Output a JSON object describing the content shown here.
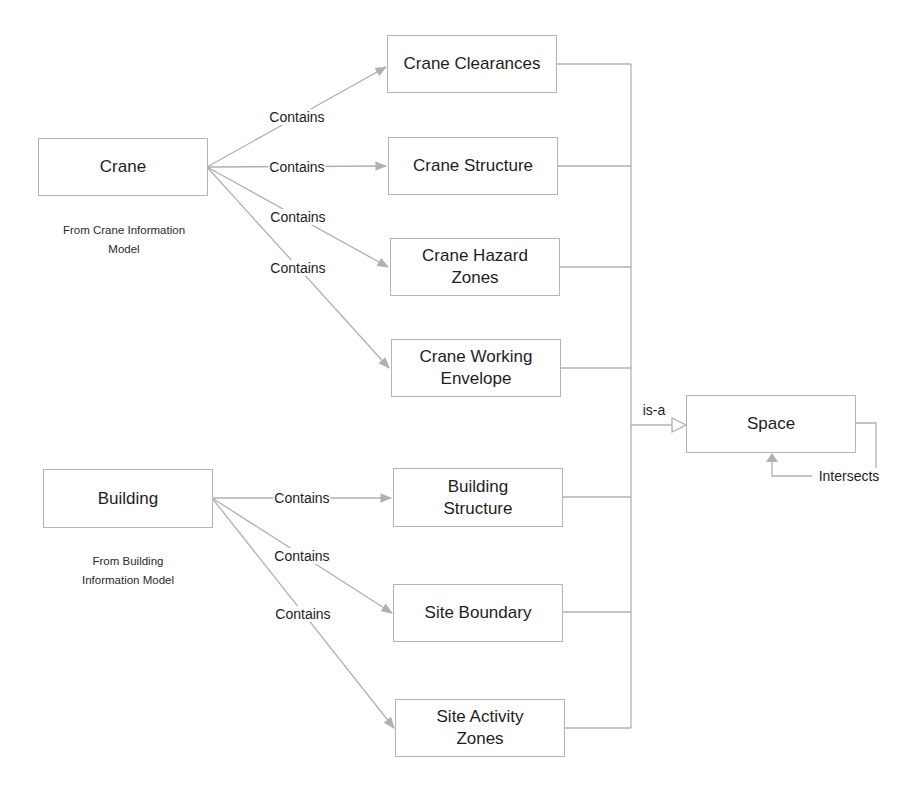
{
  "diagram": {
    "sources": [
      {
        "id": "crane",
        "label": "Crane",
        "caption_line1": "From Crane Information",
        "caption_line2": "Model"
      },
      {
        "id": "building",
        "label": "Building",
        "caption_line1": "From Building",
        "caption_line2": "Information Model"
      }
    ],
    "targets": [
      {
        "id": "crane-clearances",
        "label": "Crane Clearances"
      },
      {
        "id": "crane-structure",
        "label": "Crane Structure"
      },
      {
        "id": "crane-hazard-zones",
        "label": "Crane Hazard Zones"
      },
      {
        "id": "crane-working-envelope",
        "label": "Crane Working Envelope"
      },
      {
        "id": "building-structure",
        "label": "Building Structure"
      },
      {
        "id": "site-boundary",
        "label": "Site Boundary"
      },
      {
        "id": "site-activity-zones",
        "label": "Site Activity Zones"
      }
    ],
    "space": {
      "label": "Space"
    },
    "relations": {
      "contains": "Contains",
      "is_a": "is-a",
      "intersects": "Intersects"
    },
    "edges": [
      {
        "from": "crane",
        "to": "crane-clearances",
        "label": "Contains"
      },
      {
        "from": "crane",
        "to": "crane-structure",
        "label": "Contains"
      },
      {
        "from": "crane",
        "to": "crane-hazard-zones",
        "label": "Contains"
      },
      {
        "from": "crane",
        "to": "crane-working-envelope",
        "label": "Contains"
      },
      {
        "from": "building",
        "to": "building-structure",
        "label": "Contains"
      },
      {
        "from": "building",
        "to": "site-boundary",
        "label": "Contains"
      },
      {
        "from": "building",
        "to": "site-activity-zones",
        "label": "Contains"
      },
      {
        "from": "all-targets",
        "to": "space",
        "label": "is-a"
      },
      {
        "from": "space",
        "to": "space",
        "label": "Intersects"
      }
    ],
    "colors": {
      "line": "#b0b0b0",
      "border": "#b4b4b4",
      "text": "#1e1e1e"
    }
  }
}
